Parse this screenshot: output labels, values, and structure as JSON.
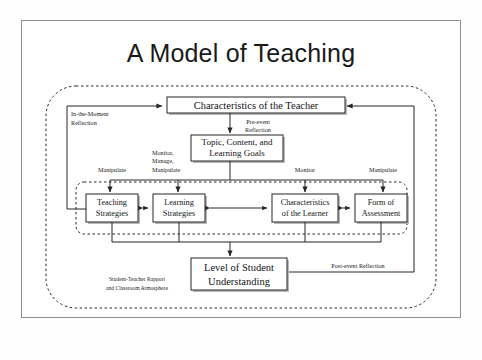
{
  "page": {
    "title": "A Model of Teaching"
  },
  "diagram": {
    "type": "flowchart",
    "nodes": [
      {
        "id": "teacher",
        "label_lines": [
          "Characteristics of the Teacher"
        ]
      },
      {
        "id": "topic",
        "label_lines": [
          "Topic, Content, and",
          "Learning Goals"
        ]
      },
      {
        "id": "teaching_strategies",
        "label_lines": [
          "Teaching",
          "Strategies"
        ]
      },
      {
        "id": "learning_strategies",
        "label_lines": [
          "Learning",
          "Strategies"
        ]
      },
      {
        "id": "learner",
        "label_lines": [
          "Characteristics",
          "of the Learner"
        ]
      },
      {
        "id": "assessment",
        "label_lines": [
          "Form of",
          "Assessment"
        ]
      },
      {
        "id": "understanding",
        "label_lines": [
          "Level of Student",
          "Understanding"
        ]
      }
    ],
    "edge_labels": [
      {
        "id": "in-the-moment-reflection",
        "lines": [
          "In-the-Moment",
          "Reflection"
        ]
      },
      {
        "id": "pre-event-reflection",
        "lines": [
          "Pre-event",
          "Reflection"
        ]
      },
      {
        "id": "manipulate-left",
        "lines": [
          "Manipulate"
        ]
      },
      {
        "id": "monitor-manage-manipulate",
        "lines": [
          "Monitor,",
          "Manage,",
          "Manipulate"
        ]
      },
      {
        "id": "monitor",
        "lines": [
          "Monitor"
        ]
      },
      {
        "id": "manipulate-right",
        "lines": [
          "Manipulate"
        ]
      },
      {
        "id": "post-event-reflection",
        "lines": [
          "Post-event Reflection"
        ]
      },
      {
        "id": "rapport-note",
        "lines": [
          "Student-Teacher Rapport",
          "and Classroom Atmosphere"
        ]
      }
    ],
    "colors": {
      "ink": "#262626",
      "page_border": "#8d8d92",
      "shadow": "#b9b9bd",
      "paper": "#ffffff"
    }
  }
}
